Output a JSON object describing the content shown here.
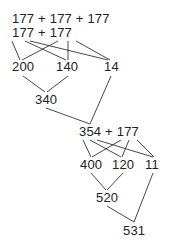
{
  "diagram": {
    "row1": "177 + 177 + 177",
    "row2": "177 + 177",
    "stage1": {
      "hundreds": "200",
      "tens": "140",
      "ones": "14",
      "partial_sum": "340"
    },
    "row3": "354 + 177",
    "stage2": {
      "hundreds": "400",
      "tens": "120",
      "ones": "11",
      "partial_sum": "520",
      "total": "531"
    },
    "line_color": "#333333"
  }
}
